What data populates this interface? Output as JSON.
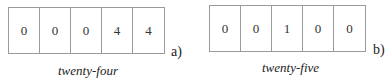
{
  "diagrams": [
    {
      "id": "a",
      "digits": [
        "0",
        "0",
        "0",
        "4",
        "4"
      ],
      "tag": "a)",
      "caption": "twenty-four"
    },
    {
      "id": "b",
      "digits": [
        "0",
        "0",
        "1",
        "0",
        "0"
      ],
      "tag": "b)",
      "caption": "twenty-five"
    }
  ]
}
